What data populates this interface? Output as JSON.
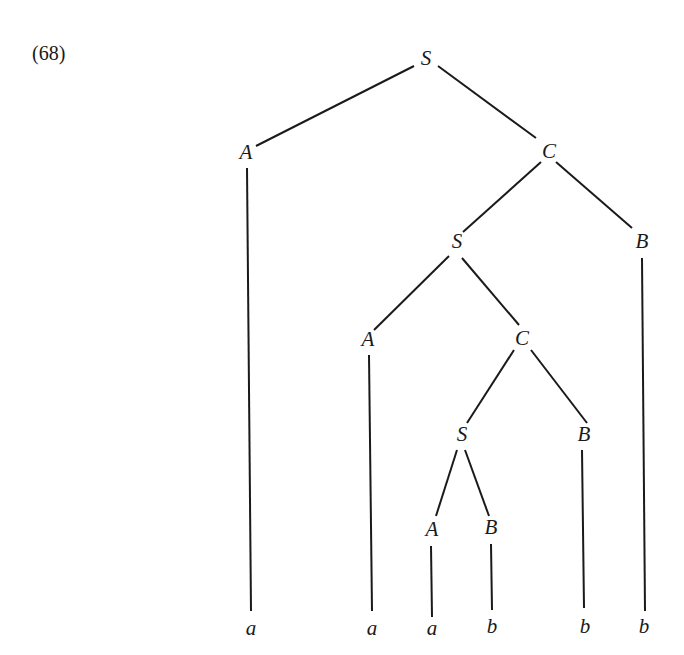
{
  "example_number": "(68)",
  "tree": {
    "nodes": [
      {
        "id": "n0",
        "label": "S",
        "x": 426,
        "y": 60
      },
      {
        "id": "n1",
        "label": "A",
        "x": 246,
        "y": 154
      },
      {
        "id": "n2",
        "label": "C",
        "x": 549,
        "y": 153
      },
      {
        "id": "n3",
        "label": "S",
        "x": 457,
        "y": 243
      },
      {
        "id": "n4",
        "label": "B",
        "x": 642,
        "y": 243
      },
      {
        "id": "n5",
        "label": "A",
        "x": 368,
        "y": 341
      },
      {
        "id": "n6",
        "label": "C",
        "x": 522,
        "y": 340
      },
      {
        "id": "n7",
        "label": "S",
        "x": 462,
        "y": 436
      },
      {
        "id": "n8",
        "label": "B",
        "x": 584,
        "y": 436
      },
      {
        "id": "n9",
        "label": "A",
        "x": 432,
        "y": 531
      },
      {
        "id": "n10",
        "label": "B",
        "x": 491,
        "y": 529
      },
      {
        "id": "n11",
        "label": "a",
        "x": 251,
        "y": 630
      },
      {
        "id": "n12",
        "label": "a",
        "x": 372,
        "y": 630
      },
      {
        "id": "n13",
        "label": "a",
        "x": 432,
        "y": 630
      },
      {
        "id": "n14",
        "label": "b",
        "x": 492,
        "y": 628
      },
      {
        "id": "n15",
        "label": "b",
        "x": 585,
        "y": 628
      },
      {
        "id": "n16",
        "label": "b",
        "x": 644,
        "y": 628
      }
    ],
    "edges": [
      {
        "x1": 414,
        "y1": 66,
        "x2": 256,
        "y2": 146
      },
      {
        "x1": 438,
        "y1": 66,
        "x2": 536,
        "y2": 138
      },
      {
        "x1": 247,
        "y1": 168,
        "x2": 251,
        "y2": 611
      },
      {
        "x1": 541,
        "y1": 162,
        "x2": 463,
        "y2": 232
      },
      {
        "x1": 556,
        "y1": 162,
        "x2": 632,
        "y2": 228
      },
      {
        "x1": 449,
        "y1": 256,
        "x2": 374,
        "y2": 330
      },
      {
        "x1": 462,
        "y1": 258,
        "x2": 519,
        "y2": 325
      },
      {
        "x1": 642,
        "y1": 258,
        "x2": 645,
        "y2": 611
      },
      {
        "x1": 369,
        "y1": 355,
        "x2": 372,
        "y2": 611
      },
      {
        "x1": 514,
        "y1": 350,
        "x2": 467,
        "y2": 423
      },
      {
        "x1": 531,
        "y1": 350,
        "x2": 587,
        "y2": 423
      },
      {
        "x1": 457,
        "y1": 450,
        "x2": 436,
        "y2": 516
      },
      {
        "x1": 465,
        "y1": 450,
        "x2": 489,
        "y2": 516
      },
      {
        "x1": 582,
        "y1": 450,
        "x2": 584,
        "y2": 608
      },
      {
        "x1": 431,
        "y1": 546,
        "x2": 432,
        "y2": 617
      },
      {
        "x1": 491,
        "y1": 544,
        "x2": 492,
        "y2": 610
      }
    ]
  }
}
